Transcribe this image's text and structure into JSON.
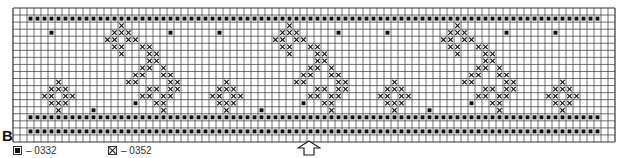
{
  "section_label": "B",
  "legend": [
    {
      "symbol": "filled-square",
      "code": "– 0332"
    },
    {
      "symbol": "cross",
      "code": "– 0352"
    }
  ],
  "arrow": "up-arrow-center-marker",
  "chart_data": {
    "type": "heatmap",
    "columns": 86,
    "rows": 19,
    "legend_codes": {
      "F": "0332",
      "X": "0352"
    },
    "border_rows": {
      "row_1": {
        "symbol": "F",
        "from_col": 2,
        "to_col": 83
      },
      "row_15": {
        "symbol": "F",
        "from_col": 2,
        "to_col": 83
      },
      "row_17": {
        "symbol": "F",
        "from_col": 2,
        "to_col": 83
      }
    },
    "motif_repeat_width": 24,
    "motif_start_col": 3,
    "motif_rows": [
      "........................",
      "........................",
      "............X...........",
      "..F........XXX.....F....",
      "..........XX.XX.........",
      "...........XX..XX.......",
      "............X...XX......",
      "................XX......",
      "...............XX.X.....",
      "..............XX..XX....",
      "...X.........XX....XX...",
      "..XXX...........XX.XX...",
      ".XX.XX.........XX.XX....",
      "..XXX.........F..XX.....",
      "...X....F.........X....."
    ]
  }
}
